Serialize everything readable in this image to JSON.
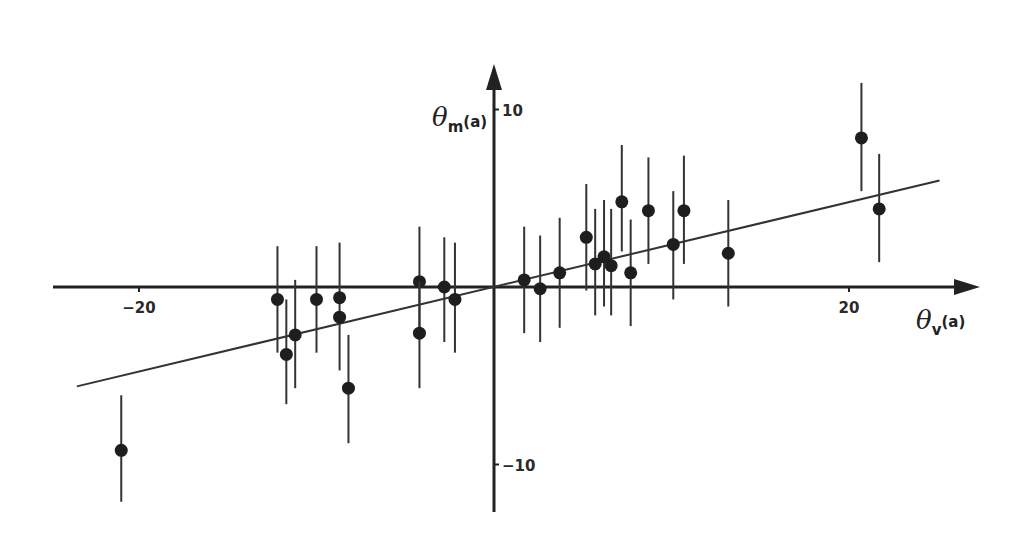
{
  "chart_data": {
    "type": "scatter",
    "title": "",
    "xlabel": "θv(a)",
    "ylabel": "θm(a)",
    "xlabel_parts": {
      "main": "θ",
      "sub": "v",
      "sup": "(a)"
    },
    "ylabel_parts": {
      "main": "θ",
      "sub": "m",
      "sup": "(a)"
    },
    "xlim": [
      -24.6,
      27.5
    ],
    "ylim": [
      -12.6,
      12.6
    ],
    "x_ticks": [
      {
        "value": -20,
        "label": "−20"
      },
      {
        "value": 20,
        "label": "20"
      }
    ],
    "y_ticks": [
      {
        "value": 10,
        "label": "10"
      },
      {
        "value": -10,
        "label": "−10"
      }
    ],
    "grid": false,
    "legend": "none",
    "axes_through_origin": true,
    "series": [
      {
        "name": "measurements",
        "marker": "filled-circle",
        "points": [
          {
            "x": -21.0,
            "y": -9.2,
            "err_low": -6.1,
            "err_high": -12.1
          },
          {
            "x": -12.2,
            "y": -0.7,
            "err_low": 2.3,
            "err_high": -3.7
          },
          {
            "x": -11.7,
            "y": -3.8,
            "err_low": -0.7,
            "err_high": -6.6
          },
          {
            "x": -11.2,
            "y": -2.7,
            "err_low": 0.4,
            "err_high": -5.7
          },
          {
            "x": -10.0,
            "y": -0.7,
            "err_low": 2.3,
            "err_high": -3.7
          },
          {
            "x": -8.7,
            "y": -0.6,
            "err_low": 2.5,
            "err_high": -4.7
          },
          {
            "x": -8.7,
            "y": -1.7
          },
          {
            "x": -8.2,
            "y": -5.7,
            "err_low": -2.7,
            "err_high": -8.8
          },
          {
            "x": -4.2,
            "y": 0.3,
            "err_low": 3.4,
            "err_high": -2.7
          },
          {
            "x": -4.2,
            "y": -2.6,
            "err_low": 0.3,
            "err_high": -5.7
          },
          {
            "x": -2.8,
            "y": 0.0,
            "err_low": 2.8,
            "err_high": -3.1
          },
          {
            "x": -2.2,
            "y": -0.7,
            "err_low": 2.5,
            "err_high": -3.7
          },
          {
            "x": 1.7,
            "y": 0.4,
            "err_low": 3.4,
            "err_high": -2.6
          },
          {
            "x": 2.6,
            "y": -0.1,
            "err_low": 2.9,
            "err_high": -3.1
          },
          {
            "x": 3.7,
            "y": 0.8,
            "err_low": 3.9,
            "err_high": -2.3
          },
          {
            "x": 5.2,
            "y": 2.8,
            "err_low": 5.8,
            "err_high": -0.2
          },
          {
            "x": 5.7,
            "y": 1.3,
            "err_low": 4.4,
            "err_high": -1.6
          },
          {
            "x": 6.2,
            "y": 1.7,
            "err_low": 4.9,
            "err_high": -1.1
          },
          {
            "x": 6.6,
            "y": 1.2,
            "err_low": 4.4,
            "err_high": -1.6
          },
          {
            "x": 7.2,
            "y": 4.8,
            "err_low": 8.0,
            "err_high": 2.0
          },
          {
            "x": 7.7,
            "y": 0.8,
            "err_low": 3.8,
            "err_high": -2.2
          },
          {
            "x": 8.7,
            "y": 4.3,
            "err_low": 7.3,
            "err_high": 1.3
          },
          {
            "x": 10.1,
            "y": 2.4,
            "err_low": 5.4,
            "err_high": -0.7
          },
          {
            "x": 10.7,
            "y": 4.3,
            "err_low": 7.4,
            "err_high": 1.3
          },
          {
            "x": 13.2,
            "y": 1.9,
            "err_low": 4.9,
            "err_high": -1.1
          },
          {
            "x": 20.7,
            "y": 8.4,
            "err_low": 11.5,
            "err_high": 5.4
          },
          {
            "x": 21.7,
            "y": 4.4,
            "err_low": 7.5,
            "err_high": 1.4
          }
        ]
      }
    ],
    "fit_line": {
      "x1": -23.5,
      "y1": -5.6,
      "x2": 25.1,
      "y2": 6.0
    }
  }
}
